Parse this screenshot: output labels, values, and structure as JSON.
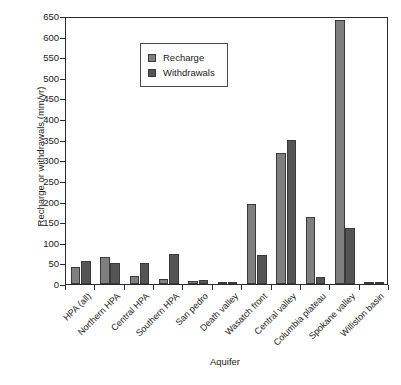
{
  "chart_data": {
    "type": "bar",
    "title": "",
    "xlabel": "Aquifer",
    "ylabel": "Recharge or withdrawals (mm/yr)",
    "ylim": [
      0,
      650
    ],
    "ytick_step": 50,
    "yticks": [
      0,
      50,
      100,
      150,
      200,
      250,
      300,
      350,
      400,
      450,
      500,
      550,
      600,
      650
    ],
    "grid": false,
    "legend_position": "top-left",
    "categories": [
      "HPA (all)",
      "Northern HPA",
      "Central HPA",
      "Southern HPA",
      "San pedro",
      "Death valley",
      "Wasatch front",
      "Central valley",
      "Columbia plateau",
      "Spokane valley",
      "Williston basin"
    ],
    "series": [
      {
        "name": "Recharge",
        "color": "#7f7f7f",
        "values": [
          42,
          65,
          20,
          11,
          8,
          3,
          193,
          318,
          163,
          640,
          5
        ]
      },
      {
        "name": "Withdrawals",
        "color": "#545454",
        "values": [
          56,
          51,
          51,
          72,
          10,
          2,
          70,
          350,
          17,
          136,
          2
        ]
      }
    ]
  },
  "legend": {
    "items": [
      {
        "label": "Recharge"
      },
      {
        "label": "Withdrawals"
      }
    ]
  },
  "colors": {
    "recharge": "#7f7f7f",
    "withdrawals": "#545454",
    "axis": "#2b2b2b",
    "background": "#ffffff"
  }
}
